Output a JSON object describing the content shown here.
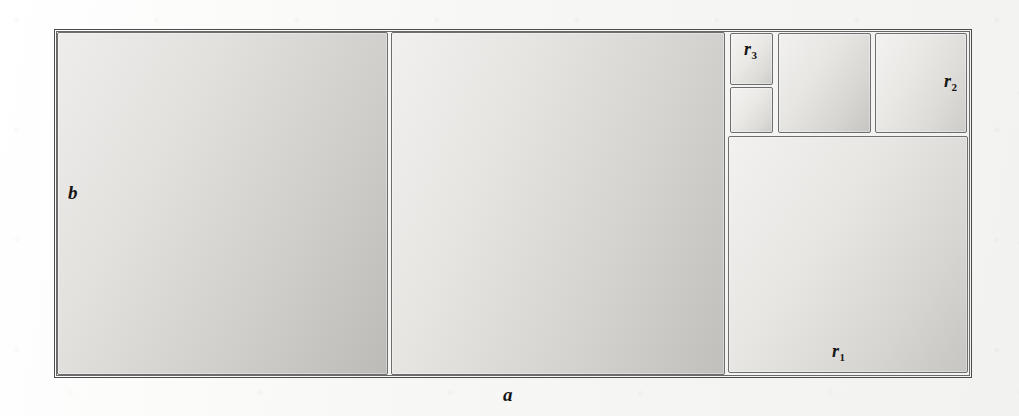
{
  "figure": {
    "kind": "squared-rectangle-dissection",
    "background_color": "#f7f7f5",
    "line_color": "#6e6e6e",
    "frame_color": "#4b4b4b",
    "label_color": "#151515"
  },
  "labels": {
    "side_horizontal": "a",
    "side_vertical": "b",
    "square_r1_base": "r",
    "square_r1_index": "1",
    "square_r2_base": "r",
    "square_r2_index": "2",
    "square_r3_base": "r",
    "square_r3_index": "3"
  },
  "cells": [
    {
      "id": "big-left-square",
      "name": "big-left-square",
      "x": 57,
      "y": 32,
      "w": 331,
      "h": 343,
      "shade": "shade-a"
    },
    {
      "id": "big-middle-square",
      "name": "big-middle-square",
      "x": 391,
      "y": 32,
      "w": 334,
      "h": 343,
      "shade": "shade-b"
    },
    {
      "id": "small-square-top",
      "name": "square-r3",
      "x": 730,
      "y": 33,
      "w": 43,
      "h": 52,
      "shade": "shade-d"
    },
    {
      "id": "small-square-bottom",
      "name": "small-square-lower",
      "x": 730,
      "y": 87,
      "w": 43,
      "h": 46,
      "shade": "shade-d"
    },
    {
      "id": "mid-top-square",
      "name": "medium-top-square",
      "x": 778,
      "y": 33,
      "w": 93,
      "h": 100,
      "shade": "shade-c"
    },
    {
      "id": "r2-square",
      "name": "square-r2",
      "x": 875,
      "y": 33,
      "w": 92,
      "h": 100,
      "shade": "shade-e"
    },
    {
      "id": "r1-square",
      "name": "square-r1",
      "x": 728,
      "y": 136,
      "w": 240,
      "h": 237,
      "shade": "shade-c"
    }
  ],
  "label_positions": {
    "b": {
      "x": 68,
      "y": 183
    },
    "a": {
      "x": 503,
      "y": 385
    },
    "r1": {
      "x": 832,
      "y": 342
    },
    "r2": {
      "x": 944,
      "y": 72
    },
    "r3": {
      "x": 744,
      "y": 40
    }
  },
  "outer_frame": {
    "x": 54,
    "y": 29,
    "w": 918,
    "h": 349
  }
}
